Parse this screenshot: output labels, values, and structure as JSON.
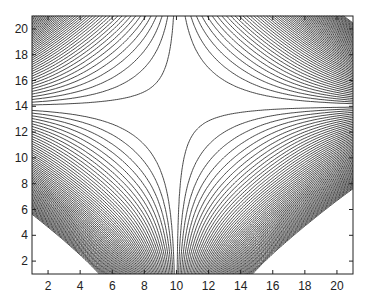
{
  "chart_data": {
    "type": "contour",
    "title": "",
    "xlabel": "",
    "ylabel": "",
    "xlim": [
      1,
      21
    ],
    "ylim": [
      1,
      21
    ],
    "xticks": [
      2,
      4,
      6,
      8,
      10,
      12,
      14,
      16,
      18,
      20
    ],
    "yticks": [
      2,
      4,
      6,
      8,
      10,
      12,
      14,
      16,
      18,
      20
    ],
    "grid": false,
    "legend": null,
    "saddle_point": [
      10,
      14
    ],
    "line_color": "#333333"
  },
  "axes": {
    "xtick_labels": [
      "2",
      "4",
      "6",
      "8",
      "10",
      "12",
      "14",
      "16",
      "18",
      "20"
    ],
    "ytick_labels": [
      "2",
      "4",
      "6",
      "8",
      "10",
      "12",
      "14",
      "16",
      "18",
      "20"
    ]
  }
}
